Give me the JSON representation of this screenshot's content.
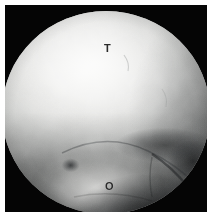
{
  "image": {
    "kind": "arthroscopic-photograph",
    "modality": "ankle arthroscopy",
    "border_color": "#ffffff",
    "surround_color": "#050505",
    "field_of_view_shape": "circular"
  },
  "annotations": [
    {
      "id": "talus",
      "letter": "T",
      "meaning": "talus",
      "color": "#2a2a2a",
      "x": 104,
      "y": 44
    },
    {
      "id": "osteochondral-lesion",
      "letter": "O",
      "meaning": "osteochondral lesion",
      "color": "#2a2a2a",
      "x": 105,
      "y": 182
    }
  ],
  "regions": {
    "upper_structure": "talar dome cartilage surface, brightly illuminated",
    "lower_structure": "convex osteochondral lesion rising from inferior field",
    "right_structure": "dark cleft / sulcus shadow along right margin",
    "defect": "small dark pit anterior to the lesion label"
  }
}
